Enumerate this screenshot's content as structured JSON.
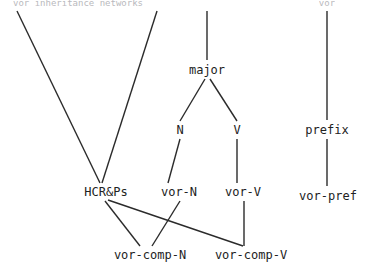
{
  "figure": {
    "title_left": "vor inheritance networks",
    "title_right": "vor",
    "background_color": "#ffffff",
    "line_color": "#2b2b2b",
    "text_color": "#222222"
  },
  "headers": [
    {
      "id": "header-left",
      "text": "vor inheritance networks",
      "x": 78,
      "y": 3
    },
    {
      "id": "header-right",
      "text": "vor",
      "x": 327,
      "y": 3
    }
  ],
  "nodes": [
    {
      "id": "major",
      "label": "major",
      "x": 207,
      "y": 70
    },
    {
      "id": "n",
      "label": "N",
      "x": 180,
      "y": 130
    },
    {
      "id": "v",
      "label": "V",
      "x": 237,
      "y": 130
    },
    {
      "id": "prefix",
      "label": "prefix",
      "x": 327,
      "y": 130
    },
    {
      "id": "hcrps",
      "label": "HCR&Ps",
      "x": 106,
      "y": 192
    },
    {
      "id": "vor-n",
      "label": "vor-N",
      "x": 179,
      "y": 192
    },
    {
      "id": "vor-v",
      "label": "vor-V",
      "x": 243,
      "y": 192
    },
    {
      "id": "vor-pref",
      "label": "vor-pref",
      "x": 328,
      "y": 196
    },
    {
      "id": "vor-comp-n",
      "label": "vor-comp-N",
      "x": 150,
      "y": 255
    },
    {
      "id": "vor-comp-v",
      "label": "vor-comp-V",
      "x": 251,
      "y": 255
    }
  ],
  "edges": [
    {
      "id": "edge-topleft-to-hcrps",
      "from": "top-left-open",
      "to": "hcrps",
      "x1": 17,
      "y1": 11,
      "x2": 100,
      "y2": 183
    },
    {
      "id": "edge-topmid-to-hcrps",
      "from": "top-mid-open",
      "to": "hcrps",
      "x1": 157,
      "y1": 11,
      "x2": 102,
      "y2": 183
    },
    {
      "id": "edge-top-to-major",
      "from": "top-open",
      "to": "major",
      "x1": 207,
      "y1": 11,
      "x2": 207,
      "y2": 60
    },
    {
      "id": "edge-major-to-n",
      "from": "major",
      "to": "n",
      "x1": 205,
      "y1": 79,
      "x2": 180,
      "y2": 121
    },
    {
      "id": "edge-major-to-v",
      "from": "major",
      "to": "v",
      "x1": 210,
      "y1": 79,
      "x2": 237,
      "y2": 121
    },
    {
      "id": "edge-n-to-vor-n",
      "from": "n",
      "to": "vor-n",
      "x1": 180,
      "y1": 139,
      "x2": 168,
      "y2": 183
    },
    {
      "id": "edge-v-to-vor-v",
      "from": "v",
      "to": "vor-v",
      "x1": 237,
      "y1": 139,
      "x2": 237,
      "y2": 183
    },
    {
      "id": "edge-top-to-prefix",
      "from": "top-open",
      "to": "prefix",
      "x1": 327,
      "y1": 11,
      "x2": 327,
      "y2": 120
    },
    {
      "id": "edge-prefix-to-vor-pref",
      "from": "prefix",
      "to": "vor-pref",
      "x1": 327,
      "y1": 139,
      "x2": 327,
      "y2": 186
    },
    {
      "id": "edge-hcrps-to-vor-comp-n",
      "from": "hcrps",
      "to": "vor-comp-n",
      "x1": 105,
      "y1": 201,
      "x2": 140,
      "y2": 246
    },
    {
      "id": "edge-hcrps-to-vor-comp-v",
      "from": "hcrps",
      "to": "vor-comp-v",
      "x1": 108,
      "y1": 200,
      "x2": 243,
      "y2": 246
    },
    {
      "id": "edge-vor-n-to-vor-comp-n",
      "from": "vor-n",
      "to": "vor-comp-n",
      "x1": 180,
      "y1": 201,
      "x2": 152,
      "y2": 246
    },
    {
      "id": "edge-vor-v-to-vor-comp-v",
      "from": "vor-v",
      "to": "vor-comp-v",
      "x1": 244,
      "y1": 201,
      "x2": 244,
      "y2": 246
    }
  ]
}
